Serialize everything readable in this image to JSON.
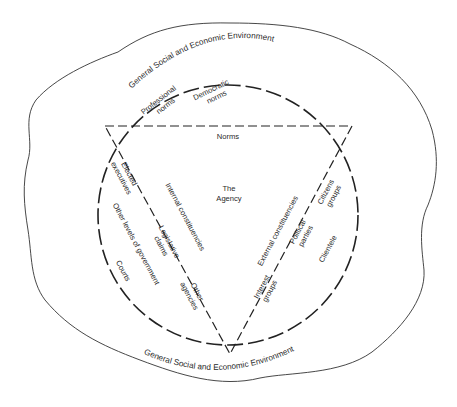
{
  "diagram": {
    "type": "conceptual-model",
    "center": {
      "title_line1": "The",
      "title_line2": "Agency"
    },
    "environment": {
      "top_label": "General Social and Economic Environment",
      "bottom_label": "General Social and Economic Environment"
    },
    "norms": {
      "edge_label": "Norms",
      "professional_line1": "Professional",
      "professional_line2": "norms",
      "democratic_line1": "Democratic",
      "democratic_line2": "norms"
    },
    "internal": {
      "edge_label": "Internal constituencies",
      "elected_line1": "Elected",
      "elected_line2": "executives",
      "other_levels": "Other levels of government",
      "courts": "Courts",
      "legislative_line1": "Legislative",
      "legislative_line2": "claims",
      "agencies_line1": "Other",
      "agencies_line2": "agencies"
    },
    "external": {
      "edge_label": "External constituencies",
      "citizens_line1": "Citizens",
      "citizens_line2": "groups",
      "political_line1": "Political",
      "political_line2": "parties",
      "clientele": "Clientele",
      "interest_line1": "Interest",
      "interest_line2": "groups"
    },
    "colors": {
      "line": "#222222",
      "text": "#2a2a2a",
      "background": "#ffffff"
    }
  }
}
